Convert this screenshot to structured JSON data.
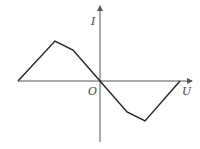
{
  "diagram": {
    "type": "I-U characteristic curve",
    "axes": {
      "x_label": "U",
      "y_label": "I",
      "origin_label": "O"
    },
    "colors": {
      "axis": "#555555",
      "curve": "#222222",
      "background": "#ffffff"
    },
    "curve_points": [
      [
        18,
        81
      ],
      [
        55,
        41
      ],
      [
        73,
        50
      ],
      [
        100,
        81
      ],
      [
        127,
        112
      ],
      [
        145,
        121
      ],
      [
        180,
        81
      ]
    ]
  }
}
